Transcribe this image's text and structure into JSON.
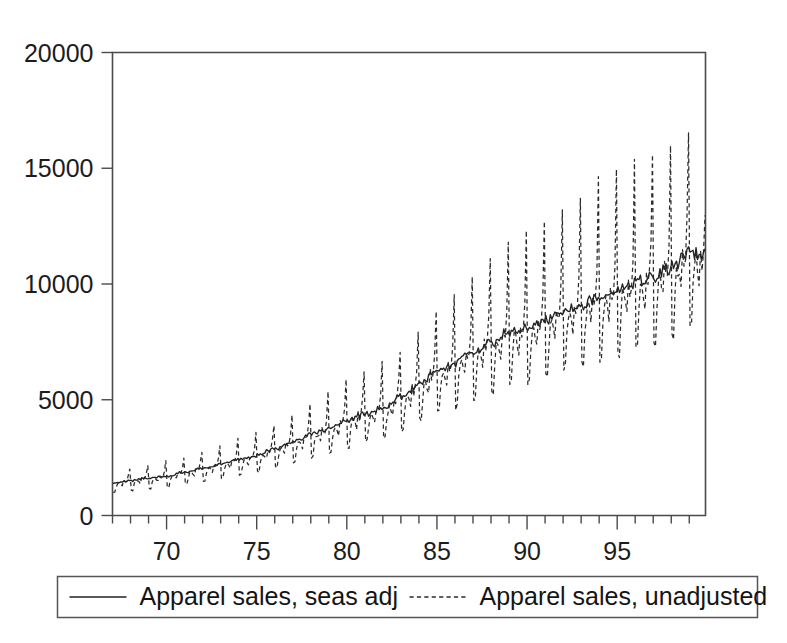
{
  "figure": {
    "background_color": "#ffffff",
    "ink_color": "#222222",
    "frame_color": "#4a4a4a"
  },
  "chart_data": {
    "type": "line",
    "title": "",
    "subtitle": "",
    "xlabel": "",
    "ylabel": "",
    "xlim": [
      1967.0,
      1999.9
    ],
    "ylim": [
      0,
      20000
    ],
    "grid": false,
    "x_tick_labels": [
      "70",
      "75",
      "80",
      "85",
      "90",
      "95"
    ],
    "x_tick_values": [
      1970,
      1975,
      1980,
      1985,
      1990,
      1995
    ],
    "x_minor_tick_step": 1,
    "y_tick_labels": [
      "0",
      "5000",
      "10000",
      "15000",
      "20000"
    ],
    "y_tick_values": [
      0,
      5000,
      10000,
      15000,
      20000
    ],
    "legend_position": "below-outside",
    "series": [
      {
        "name": "Apparel sales, seas adj",
        "style": "solid",
        "color": "#222222",
        "frequency": "monthly",
        "start": 1967.0,
        "description": "Seasonally adjusted monthly US apparel and accessory store sales, smooth upward trend from about 1400 to about 11300",
        "annual_level_values": [
          1400,
          1500,
          1620,
          1700,
          1880,
          2030,
          2220,
          2420,
          2600,
          2880,
          3180,
          3480,
          3780,
          4040,
          4380,
          4620,
          5120,
          5700,
          6180,
          6620,
          7080,
          7500,
          7880,
          8120,
          8450,
          8820,
          9100,
          9420,
          9720,
          10050,
          10380,
          10750,
          11300
        ],
        "annual_level_years": [
          1967,
          1968,
          1969,
          1970,
          1971,
          1972,
          1973,
          1974,
          1975,
          1976,
          1977,
          1978,
          1979,
          1980,
          1981,
          1982,
          1983,
          1984,
          1985,
          1986,
          1987,
          1988,
          1989,
          1990,
          1991,
          1992,
          1993,
          1994,
          1995,
          1996,
          1997,
          1998,
          1999
        ]
      },
      {
        "name": "Apparel sales, unadjusted",
        "style": "dashed",
        "color": "#2b2b2b",
        "frequency": "monthly",
        "start": 1967.0,
        "description": "Unadjusted monthly series with large December peaks and January/February troughs; amplitude grows with the level",
        "seasonal_factors": {
          "jan": 0.72,
          "feb": 0.72,
          "mar": 0.88,
          "apr": 0.97,
          "may": 0.98,
          "jun": 0.94,
          "jul": 0.88,
          "aug": 1.02,
          "sep": 0.97,
          "oct": 1.0,
          "nov": 1.12,
          "dec": 1.62
        },
        "december_peak_values": [
          2000,
          2150,
          2350,
          2500,
          2750,
          3000,
          3300,
          3600,
          3900,
          4350,
          4850,
          5350,
          5850,
          6200,
          6700,
          7050,
          7900,
          8800,
          9600,
          10300,
          11000,
          11700,
          12300,
          12700,
          13200,
          13800,
          14700,
          15100,
          15400,
          15500,
          15900,
          16400,
          17000
        ],
        "december_peak_years": [
          1967,
          1968,
          1969,
          1970,
          1971,
          1972,
          1973,
          1974,
          1975,
          1976,
          1977,
          1978,
          1979,
          1980,
          1981,
          1982,
          1983,
          1984,
          1985,
          1986,
          1987,
          1988,
          1989,
          1990,
          1991,
          1992,
          1993,
          1994,
          1995,
          1996,
          1997,
          1998,
          1999
        ],
        "january_trough_values": [
          1050,
          1120,
          1200,
          1260,
          1380,
          1500,
          1640,
          1780,
          1920,
          2130,
          2350,
          2580,
          2800,
          2980,
          3220,
          3400,
          3780,
          4200,
          4560,
          4880,
          5220,
          5540,
          5820,
          6000,
          6240,
          6520,
          6720,
          6960,
          7180,
          7420,
          7660,
          7940,
          8340
        ]
      }
    ]
  },
  "legend": {
    "items": [
      {
        "label": "Apparel sales, seas adj",
        "style": "solid"
      },
      {
        "label": "Apparel sales, unadjusted",
        "style": "dashed"
      }
    ]
  }
}
